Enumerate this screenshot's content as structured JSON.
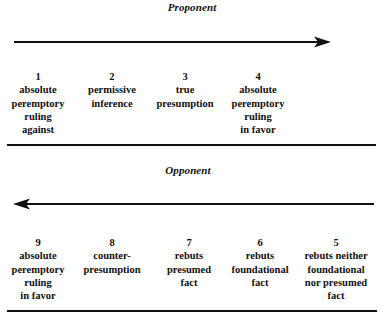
{
  "proponent": {
    "heading": "Proponent",
    "arrow_direction": "right",
    "columns": [
      {
        "number": "1",
        "lines": [
          "absolute",
          "peremptory",
          "ruling",
          "against"
        ]
      },
      {
        "number": "2",
        "lines": [
          "permissive",
          "inference"
        ]
      },
      {
        "number": "3",
        "lines": [
          "true",
          "presumption"
        ]
      },
      {
        "number": "4",
        "lines": [
          "absolute",
          "peremptory",
          "ruling",
          "in favor"
        ]
      }
    ]
  },
  "opponent": {
    "heading": "Opponent",
    "arrow_direction": "left",
    "columns": [
      {
        "number": "9",
        "lines": [
          "absolute",
          "peremptory",
          "ruling",
          "in favor"
        ]
      },
      {
        "number": "8",
        "lines": [
          "counter-",
          "presumption"
        ]
      },
      {
        "number": "7",
        "lines": [
          "rebuts",
          "presumed",
          "fact"
        ]
      },
      {
        "number": "6",
        "lines": [
          "rebuts",
          "foundational",
          "fact"
        ]
      },
      {
        "number": "5",
        "lines": [
          "rebuts neither",
          "foundational",
          "nor presumed",
          "fact"
        ]
      }
    ]
  },
  "colors": {
    "ink": "#111111",
    "background": "#ffffff"
  }
}
